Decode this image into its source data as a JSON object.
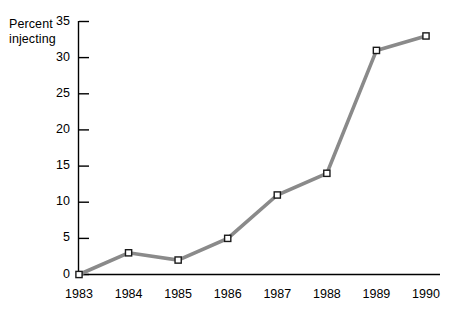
{
  "chart_data": {
    "type": "line",
    "title": "",
    "subtitle": "",
    "xlabel": "",
    "ylabel": "Percent injecting",
    "ylabel_lines": [
      "Percent",
      "injecting"
    ],
    "categories": [
      "1983",
      "1984",
      "1985",
      "1986",
      "1987",
      "1988",
      "1989",
      "1990"
    ],
    "x": [
      1983,
      1984,
      1985,
      1986,
      1987,
      1988,
      1989,
      1990
    ],
    "values": [
      0,
      3,
      2,
      5,
      11,
      14,
      31,
      33
    ],
    "series": [
      {
        "name": "Percent injecting",
        "values": [
          0,
          3,
          2,
          5,
          11,
          14,
          31,
          33
        ]
      }
    ],
    "ylim": [
      0,
      35
    ],
    "xlim": [
      1983,
      1990
    ],
    "y_ticks": [
      0,
      5,
      10,
      15,
      20,
      25,
      30,
      35
    ],
    "y_tick_labels": [
      "0",
      "5",
      "10",
      "15",
      "20",
      "25",
      "30",
      "35"
    ],
    "x_tick_labels": [
      "1983",
      "1984",
      "1985",
      "1986",
      "1987",
      "1988",
      "1989",
      "1990"
    ],
    "grid": false,
    "legend": false,
    "legend_position": "none",
    "marker": "open-square",
    "line_color": "#8a8a8a",
    "marker_fill": "#ffffff",
    "marker_edge_color": "#1a1a1a",
    "axis_color": "#000000",
    "background_color": "#ffffff",
    "annotations": []
  }
}
